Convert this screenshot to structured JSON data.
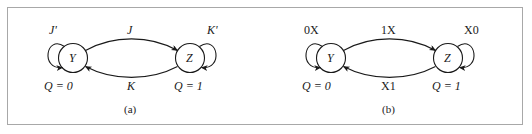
{
  "figure": {
    "background_color": "#ffffff",
    "border_color": "#a8a8a8",
    "stroke_color": "#1a1a1a",
    "text_color": "#1a1a1a"
  },
  "panels": [
    {
      "id": "a",
      "caption": "(a)",
      "states": [
        {
          "id": "left",
          "name": "Y",
          "output_label": "Q = 0"
        },
        {
          "id": "right",
          "name": "Z",
          "output_label": "Q = 1"
        }
      ],
      "transitions": [
        {
          "id": "self-left",
          "label": "J'",
          "from": "Y",
          "to": "Y"
        },
        {
          "id": "left-to-right",
          "label": "J",
          "from": "Y",
          "to": "Z"
        },
        {
          "id": "right-to-left",
          "label": "K",
          "from": "Z",
          "to": "Y"
        },
        {
          "id": "self-right",
          "label": "K'",
          "from": "Z",
          "to": "Z"
        }
      ]
    },
    {
      "id": "b",
      "caption": "(b)",
      "states": [
        {
          "id": "left",
          "name": "Y",
          "output_label": "Q = 0"
        },
        {
          "id": "right",
          "name": "Z",
          "output_label": "Q = 1"
        }
      ],
      "transitions": [
        {
          "id": "self-left",
          "label": "0X",
          "from": "Y",
          "to": "Y"
        },
        {
          "id": "left-to-right",
          "label": "1X",
          "from": "Y",
          "to": "Z"
        },
        {
          "id": "right-to-left",
          "label": "X1",
          "from": "Z",
          "to": "Y"
        },
        {
          "id": "self-right",
          "label": "X0",
          "from": "Z",
          "to": "Z"
        }
      ]
    }
  ]
}
